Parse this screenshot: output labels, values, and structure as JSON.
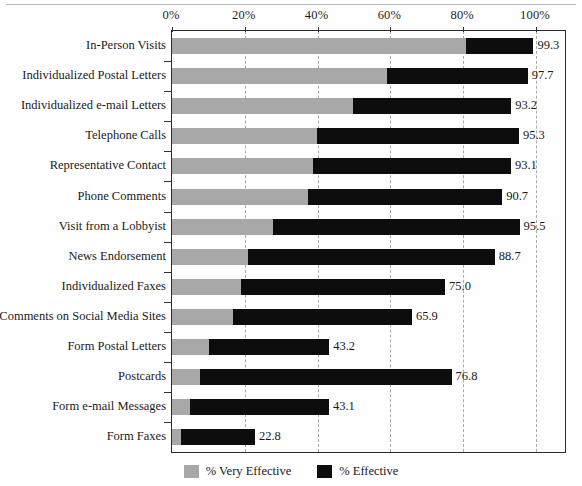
{
  "chart_data": {
    "type": "bar",
    "orientation": "horizontal",
    "stacked": true,
    "title": "",
    "xlabel": "",
    "ylabel": "",
    "xlim": [
      0,
      100
    ],
    "xticks": [
      "0%",
      "20%",
      "40%",
      "60%",
      "80%",
      "100%"
    ],
    "xtick_values": [
      0,
      20,
      40,
      60,
      80,
      100
    ],
    "grid": "vertical-dashed",
    "legend_position": "bottom-center",
    "legend": [
      "% Very Effective",
      "% Effective"
    ],
    "series": [
      {
        "name": "% Very Effective",
        "color": "#a8a8a8",
        "values": [
          80.8,
          59.0,
          49.7,
          39.8,
          38.7,
          37.4,
          27.7,
          20.9,
          19.0,
          16.8,
          10.2,
          7.7,
          5.0,
          2.5
        ]
      },
      {
        "name": "% Effective",
        "color": "#0d0d0d",
        "values": [
          18.5,
          38.7,
          43.5,
          55.5,
          54.4,
          53.3,
          67.8,
          67.8,
          56.0,
          49.1,
          33.0,
          69.1,
          38.1,
          20.3
        ]
      }
    ],
    "categories": [
      "In-Person Visits",
      "Individualized Postal Letters",
      "Individualized e-mail Letters",
      "Telephone Calls",
      "Representative Contact",
      "Phone Comments",
      "Visit from a Lobbyist",
      "News Endorsement",
      "Individualized Faxes",
      "Comments on Social Media Sites",
      "Form Postal Letters",
      "Postcards",
      "Form e-mail Messages",
      "Form Faxes"
    ],
    "totals": [
      99.3,
      97.7,
      93.2,
      95.3,
      93.1,
      90.7,
      95.5,
      88.7,
      75.0,
      65.9,
      43.2,
      76.8,
      43.1,
      22.8
    ],
    "total_labels": [
      "99.3",
      "97.7",
      "93.2",
      "95.3",
      "93.1",
      "90.7",
      "95.5",
      "88.7",
      "75.0",
      "65.9",
      "43.2",
      "76.8",
      "43.1",
      "22.8"
    ],
    "rows": [
      {
        "label": "In-Person Visits",
        "very_effective": 80.8,
        "effective": 18.5,
        "total": "99.3"
      },
      {
        "label": "Individualized Postal Letters",
        "very_effective": 59.0,
        "effective": 38.7,
        "total": "97.7"
      },
      {
        "label": "Individualized e-mail Letters",
        "very_effective": 49.7,
        "effective": 43.5,
        "total": "93.2"
      },
      {
        "label": "Telephone Calls",
        "very_effective": 39.8,
        "effective": 55.5,
        "total": "95.3"
      },
      {
        "label": "Representative Contact",
        "very_effective": 38.7,
        "effective": 54.4,
        "total": "93.1"
      },
      {
        "label": "Phone Comments",
        "very_effective": 37.4,
        "effective": 53.3,
        "total": "90.7"
      },
      {
        "label": "Visit from a Lobbyist",
        "very_effective": 27.7,
        "effective": 67.8,
        "total": "95.5"
      },
      {
        "label": "News Endorsement",
        "very_effective": 20.9,
        "effective": 67.8,
        "total": "88.7"
      },
      {
        "label": "Individualized Faxes",
        "very_effective": 19.0,
        "effective": 56.0,
        "total": "75.0"
      },
      {
        "label": "Comments on Social Media Sites",
        "very_effective": 16.8,
        "effective": 49.1,
        "total": "65.9"
      },
      {
        "label": "Form Postal Letters",
        "very_effective": 10.2,
        "effective": 33.0,
        "total": "43.2"
      },
      {
        "label": "Postcards",
        "very_effective": 7.7,
        "effective": 69.1,
        "total": "76.8"
      },
      {
        "label": "Form e-mail Messages",
        "very_effective": 5.0,
        "effective": 38.1,
        "total": "43.1"
      },
      {
        "label": "Form Faxes",
        "very_effective": 2.5,
        "effective": 20.3,
        "total": "22.8"
      }
    ]
  },
  "legend": {
    "items": [
      {
        "label": "% Very Effective",
        "color": "#a8a8a8"
      },
      {
        "label": "% Effective",
        "color": "#0d0d0d"
      }
    ]
  },
  "axis": {
    "ticks": [
      {
        "label": "0%",
        "value": 0
      },
      {
        "label": "20%",
        "value": 20
      },
      {
        "label": "40%",
        "value": 40
      },
      {
        "label": "60%",
        "value": 60
      },
      {
        "label": "80%",
        "value": 80
      },
      {
        "label": "100%",
        "value": 100
      }
    ]
  }
}
